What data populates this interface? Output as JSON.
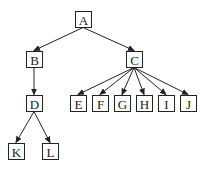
{
  "diagram": {
    "type": "tree",
    "colors": {
      "stroke": "#222222",
      "background": "#ffffff",
      "node_fill": "#ffffff"
    },
    "nodes": [
      {
        "id": "A",
        "label": "A",
        "x": 75,
        "y": 11,
        "w": 16,
        "h": 16
      },
      {
        "id": "B",
        "label": "B",
        "x": 26,
        "y": 51,
        "w": 16,
        "h": 16
      },
      {
        "id": "C",
        "label": "C",
        "x": 126,
        "y": 51,
        "w": 16,
        "h": 16
      },
      {
        "id": "D",
        "label": "D",
        "x": 26,
        "y": 95,
        "w": 16,
        "h": 16
      },
      {
        "id": "E",
        "label": "E",
        "x": 70,
        "y": 95,
        "w": 16,
        "h": 16
      },
      {
        "id": "F",
        "label": "F",
        "x": 92,
        "y": 95,
        "w": 16,
        "h": 16
      },
      {
        "id": "G",
        "label": "G",
        "x": 114,
        "y": 95,
        "w": 16,
        "h": 16
      },
      {
        "id": "H",
        "label": "H",
        "x": 136,
        "y": 95,
        "w": 16,
        "h": 16
      },
      {
        "id": "I",
        "label": "I",
        "x": 158,
        "y": 95,
        "w": 16,
        "h": 16
      },
      {
        "id": "J",
        "label": "J",
        "x": 180,
        "y": 95,
        "w": 16,
        "h": 16
      },
      {
        "id": "K",
        "label": "K",
        "x": 8,
        "y": 143,
        "w": 16,
        "h": 16
      },
      {
        "id": "L",
        "label": "L",
        "x": 42,
        "y": 143,
        "w": 16,
        "h": 16
      }
    ],
    "edges": [
      {
        "from": "A",
        "to": "B",
        "arrow": true
      },
      {
        "from": "A",
        "to": "C",
        "arrow": true
      },
      {
        "from": "B",
        "to": "D",
        "arrow": true
      },
      {
        "from": "C",
        "to": "E",
        "arrow": true
      },
      {
        "from": "C",
        "to": "F",
        "arrow": true
      },
      {
        "from": "C",
        "to": "G",
        "arrow": true
      },
      {
        "from": "C",
        "to": "H",
        "arrow": true
      },
      {
        "from": "C",
        "to": "I",
        "arrow": true
      },
      {
        "from": "C",
        "to": "J",
        "arrow": true
      },
      {
        "from": "D",
        "to": "K",
        "arrow": true
      },
      {
        "from": "D",
        "to": "L",
        "arrow": true
      }
    ]
  }
}
